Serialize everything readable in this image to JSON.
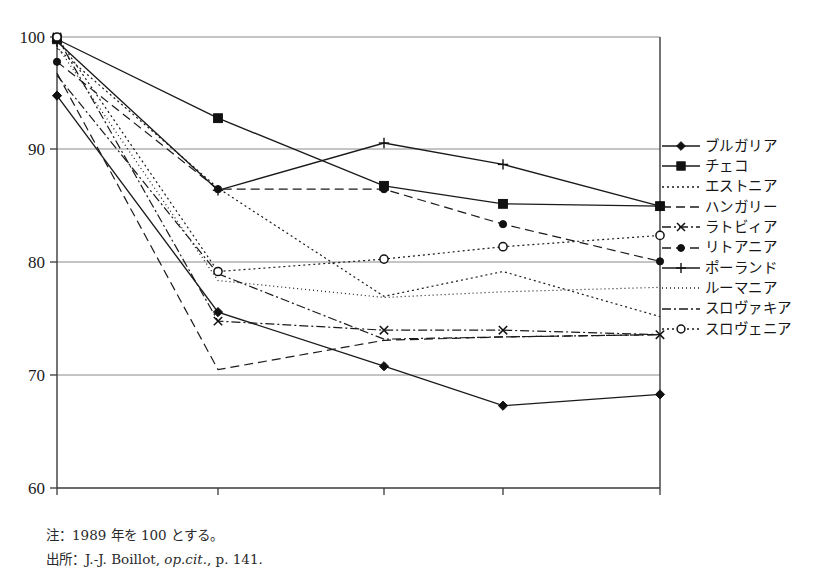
{
  "chart_data": {
    "type": "line",
    "title": "",
    "subtitle": "",
    "xlabel": "",
    "ylabel": "",
    "categories": [
      "1990",
      "1995",
      "1999",
      "2000",
      "2001"
    ],
    "ylim": [
      60,
      100
    ],
    "yticks": [
      60,
      70,
      80,
      90,
      100
    ],
    "grid": "horizontal",
    "legend_position": "right",
    "series": [
      {
        "name": "ブルガリア",
        "marker": "diamond-filled",
        "line": "solid",
        "values": [
          94.8,
          75.6,
          70.8,
          67.3,
          68.3
        ]
      },
      {
        "name": "チェコ",
        "marker": "square-filled",
        "line": "solid",
        "values": [
          99.8,
          92.8,
          86.8,
          85.2,
          85.0
        ]
      },
      {
        "name": "エストニア",
        "marker": "none",
        "line": "dotted",
        "values": [
          99.0,
          86.6,
          77.0,
          79.2,
          75.2
        ]
      },
      {
        "name": "ハンガリー",
        "marker": "none",
        "line": "dashed",
        "values": [
          96.8,
          70.5,
          73.1,
          73.4,
          73.6
        ]
      },
      {
        "name": "ラトビィア",
        "marker": "cross",
        "line": "dash-dot",
        "values": [
          100.0,
          74.8,
          74.0,
          74.0,
          73.6
        ]
      },
      {
        "name": "リトアニア",
        "marker": "circle-filled",
        "line": "dashed",
        "values": [
          97.8,
          86.5,
          86.5,
          83.4,
          80.1
        ]
      },
      {
        "name": "ポーランド",
        "marker": "plus",
        "line": "solid",
        "values": [
          99.6,
          86.4,
          90.6,
          88.7,
          85.0
        ]
      },
      {
        "name": "ルーマニア",
        "marker": "none",
        "line": "fine-dot",
        "values": [
          99.2,
          78.4,
          76.9,
          77.4,
          77.8
        ]
      },
      {
        "name": "スロヴァキア",
        "marker": "none",
        "line": "dash-dot",
        "values": [
          96.6,
          79.0,
          73.2,
          73.4,
          73.6
        ]
      },
      {
        "name": "スロヴェニア",
        "marker": "circle-open",
        "line": "dotted",
        "values": [
          100.0,
          79.2,
          80.3,
          81.4,
          82.4
        ]
      }
    ]
  },
  "axes": {
    "y_tick_labels": [
      "100",
      "90",
      "80",
      "70",
      "60"
    ],
    "x_tick_labels": [
      "1990",
      "1995",
      "1999",
      "2000",
      "2001"
    ]
  },
  "legend": {
    "items": [
      {
        "label": "ブルガリア"
      },
      {
        "label": "チェコ"
      },
      {
        "label": "エストニア"
      },
      {
        "label": "ハンガリー"
      },
      {
        "label": "ラトビィア"
      },
      {
        "label": "リトアニア"
      },
      {
        "label": "ポーランド"
      },
      {
        "label": "ルーマニア"
      },
      {
        "label": "スロヴァキア"
      },
      {
        "label": "スロヴェニア"
      }
    ]
  },
  "notes": {
    "note_label": "注：1989 年を 100 とする。",
    "source_prefix": "出所：J.-J. Boillot, ",
    "source_italic": "op.cit.",
    "source_suffix": ", p. 141."
  },
  "colors": {
    "ink": "#1a1a1a",
    "grid": "#8a8a8a",
    "axis": "#3a3a3a",
    "background": "#ffffff"
  }
}
